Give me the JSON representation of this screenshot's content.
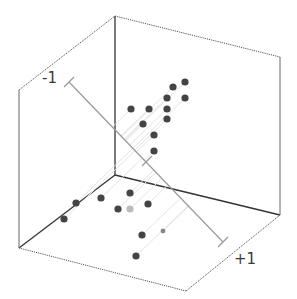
{
  "chart_data": {
    "type": "scatter",
    "projection": "3d",
    "title": "",
    "xlabel": "",
    "ylabel": "",
    "zlabel": "",
    "axis_labels": {
      "start": "-1",
      "end": "+1"
    },
    "axis_ticks": [
      "-1",
      "0",
      "+1"
    ],
    "grid": false,
    "legend": null,
    "colors": {
      "point": "#444444",
      "point_highlight": "#bbbbbb",
      "point_small": "#888888",
      "box_solid": "#333333",
      "box_dotted": "#555555",
      "axis_line": "#999999",
      "projection_line": "#e4e4e4"
    },
    "points_screen_px": [
      {
        "x": 185,
        "y": 82
      },
      {
        "x": 173,
        "y": 87
      },
      {
        "x": 167,
        "y": 98
      },
      {
        "x": 185,
        "y": 98
      },
      {
        "x": 131,
        "y": 109
      },
      {
        "x": 149,
        "y": 109
      },
      {
        "x": 167,
        "y": 109
      },
      {
        "x": 167,
        "y": 119
      },
      {
        "x": 143,
        "y": 124
      },
      {
        "x": 154,
        "y": 135
      },
      {
        "x": 154,
        "y": 151
      },
      {
        "x": 130,
        "y": 193
      },
      {
        "x": 101,
        "y": 198
      },
      {
        "x": 76,
        "y": 203
      },
      {
        "x": 148,
        "y": 204
      },
      {
        "x": 118,
        "y": 209
      },
      {
        "x": 130,
        "y": 209,
        "style": "highlight"
      },
      {
        "x": 64,
        "y": 219
      },
      {
        "x": 163,
        "y": 231,
        "style": "small"
      },
      {
        "x": 142,
        "y": 235
      },
      {
        "x": 136,
        "y": 256
      }
    ]
  }
}
